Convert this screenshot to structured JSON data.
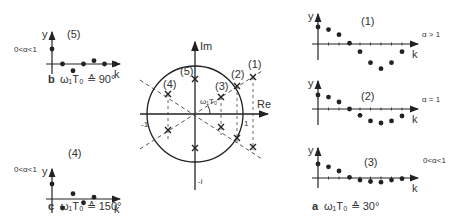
{
  "figure": {
    "center": {
      "axis_im": "Im",
      "axis_re": "Re",
      "tick_pos_real": "1",
      "tick_neg_real": "-1",
      "tick_neg_imag": "-i",
      "angle_label": "ω₁T₀",
      "pole_labels": [
        "(1)",
        "(2)",
        "(3)",
        "(4)",
        "(5)"
      ]
    },
    "panels": {
      "p1": {
        "label": "(1)",
        "condition": "α > 1",
        "y": "y",
        "k": "k"
      },
      "p2": {
        "label": "(2)",
        "condition": "α = 1",
        "y": "y",
        "k": "k"
      },
      "p3": {
        "label": "(3)",
        "condition": "0<α<1",
        "y": "y",
        "k": "k"
      },
      "p4": {
        "label": "(4)",
        "condition": "0<α<1",
        "y": "y",
        "k": "k"
      },
      "p5": {
        "label": "(5)",
        "condition": "0<α<1",
        "y": "y",
        "k": "k"
      }
    },
    "captions": {
      "a_letter": "a",
      "a_text": "ω₁T₀ ≙ 30°",
      "b_letter": "b",
      "b_text": "ω₁T₀ ≙ 90°",
      "c_letter": "c",
      "c_text": "ω₁T₀ ≙ 150°"
    }
  },
  "chart_data": [
    {
      "type": "scatter",
      "title": "(1) α > 1",
      "x": [
        0,
        1,
        2,
        3,
        4,
        5,
        6,
        7,
        8
      ],
      "values": [
        1.0,
        0.85,
        0.55,
        0.05,
        -0.45,
        -1.1,
        -1.45,
        -1.1,
        -0.45
      ]
    },
    {
      "type": "scatter",
      "title": "(2) α = 1",
      "x": [
        0,
        1,
        2,
        3,
        4,
        5,
        6,
        7,
        8
      ],
      "values": [
        1.0,
        0.85,
        0.5,
        0.0,
        -0.45,
        -0.85,
        -1.0,
        -0.85,
        -0.5
      ]
    },
    {
      "type": "scatter",
      "title": "(3) 0<α<1",
      "x": [
        0,
        1,
        2,
        3,
        4,
        5,
        6,
        7,
        8
      ],
      "values": [
        1.0,
        0.8,
        0.5,
        0.05,
        -0.15,
        -0.25,
        -0.3,
        -0.15,
        -0.05
      ]
    },
    {
      "type": "scatter",
      "title": "(4) 0<α<1",
      "x": [
        0,
        1,
        2,
        3,
        4
      ],
      "values": [
        1.0,
        -0.6,
        0.35,
        -0.25,
        0.12
      ]
    },
    {
      "type": "scatter",
      "title": "(5) 0<α<1",
      "x": [
        0,
        1,
        2,
        3,
        4,
        5,
        6
      ],
      "values": [
        1.0,
        0.0,
        -0.45,
        0.0,
        0.22,
        0.0,
        0.0
      ]
    }
  ]
}
